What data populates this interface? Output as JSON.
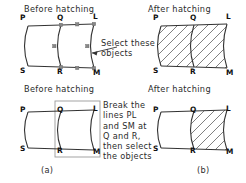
{
  "document": {
    "type": "cad-hatching-instruction-figure",
    "line_color": "#333333",
    "hatch_color": "#555555",
    "grip_color": "#777777",
    "selection_box_color": "#999999",
    "background": "#ffffff"
  },
  "panels": [
    {
      "id": "top-left",
      "caption": "Before hatching",
      "figure_caption": "",
      "vertices": [
        "P",
        "Q",
        "L",
        "S",
        "R",
        "M"
      ],
      "hatched_regions": [],
      "grips_visible": true,
      "selection_box": false
    },
    {
      "id": "top-right",
      "caption": "After hatching",
      "figure_caption": "",
      "vertices": [
        "P",
        "Q",
        "L",
        "S",
        "R",
        "M"
      ],
      "hatched_regions": [
        "left",
        "right"
      ],
      "grips_visible": false,
      "selection_box": false
    },
    {
      "id": "bottom-left",
      "caption": "Before hatching",
      "figure_caption": "(a)",
      "vertices": [
        "P",
        "Q",
        "L",
        "S",
        "R",
        "M"
      ],
      "hatched_regions": [],
      "grips_visible": false,
      "selection_box": true
    },
    {
      "id": "bottom-right",
      "caption": "After hatching",
      "figure_caption": "(b)",
      "vertices": [
        "P",
        "Q",
        "L",
        "S",
        "R",
        "M"
      ],
      "hatched_regions": [
        "right"
      ],
      "grips_visible": false,
      "selection_box": false
    }
  ],
  "annotations": {
    "select_objects": "Select these\nobjects",
    "break_lines": "Break the\nlines PL\nand SM at\nQ and R,\nthen select\nthe objects"
  },
  "labels": {
    "P": "P",
    "Q": "Q",
    "L": "L",
    "S": "S",
    "R": "R",
    "M": "M"
  }
}
